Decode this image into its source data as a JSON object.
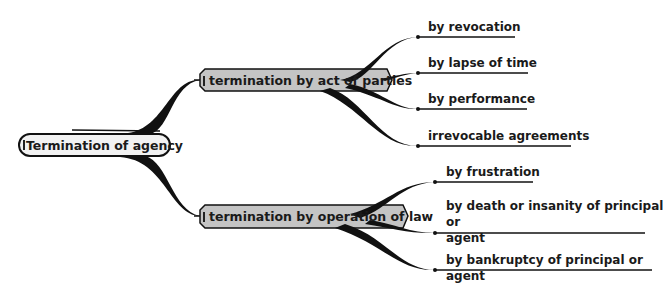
{
  "root": {
    "label": "Termination of agency",
    "toggle_icon": "collapse-minus-icon"
  },
  "branches": [
    {
      "label": "termination by act of parties",
      "toggle_icon": "collapse-minus-icon",
      "children": [
        {
          "label": "by revocation"
        },
        {
          "label": "by lapse of time"
        },
        {
          "label": "by performance"
        },
        {
          "label": "irrevocable agreements"
        }
      ]
    },
    {
      "label": "termination by operation of law",
      "toggle_icon": "collapse-minus-icon",
      "children": [
        {
          "label": "by frustration"
        },
        {
          "label": "by death or insanity of principal or",
          "label_line2": "agent"
        },
        {
          "label": "by bankruptcy of principal or agent"
        }
      ]
    }
  ],
  "colors": {
    "branch_fill": "#c4c4c4",
    "root_fill": "#f2f2f2",
    "stroke": "#111111",
    "background": "#ffffff"
  }
}
